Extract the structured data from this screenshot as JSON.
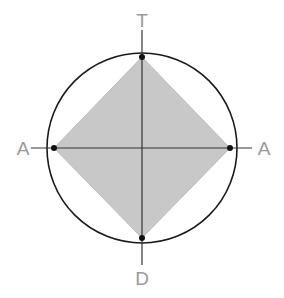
{
  "diagram": {
    "labels": {
      "top": "T",
      "bottom": "D",
      "left": "A",
      "right": "A"
    },
    "center": [
      142,
      148
    ],
    "circle_radius": 95,
    "vertices": {
      "top": [
        142,
        57
      ],
      "bottom": [
        142,
        238
      ],
      "left": [
        54,
        148
      ],
      "right": [
        230,
        148
      ]
    },
    "colors": {
      "fill": "#c8c8c8",
      "lines": "#222222",
      "labels": "#9a9a9a",
      "axis_ext": "#666666"
    }
  }
}
